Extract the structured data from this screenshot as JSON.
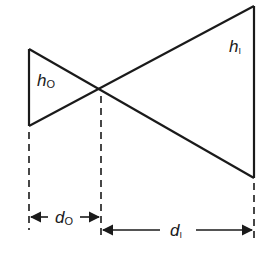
{
  "diagram": {
    "labels": {
      "object_height": {
        "main": "h",
        "sub": "O"
      },
      "image_height": {
        "main": "h",
        "sub": "I"
      },
      "object_distance": {
        "main": "d",
        "sub": "O"
      },
      "image_distance": {
        "main": "d",
        "sub": "I"
      }
    },
    "colors": {
      "stroke": "#1a1a1a",
      "background": "#ffffff"
    }
  }
}
